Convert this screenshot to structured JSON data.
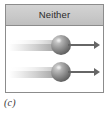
{
  "figure": {
    "caption": "(c)",
    "panel": {
      "header_title": "Neither",
      "header_bg_color": "#c9c9c9",
      "border_color": "#8c8c8c",
      "body_bg_color": "#ffffff"
    },
    "rows": [
      {
        "index": 1,
        "tail_label": "",
        "sphere_label": "",
        "arrow_label": "",
        "arrow_direction": "right"
      },
      {
        "index": 2,
        "tail_label": "",
        "sphere_label": "",
        "arrow_label": "",
        "arrow_direction": "right"
      }
    ],
    "colors": {
      "sphere_dark": "#3f3f3f",
      "sphere_light": "#d8d8d8",
      "arrow": "#666666",
      "tail_start": "#ffffff",
      "tail_end": "#969696"
    }
  }
}
